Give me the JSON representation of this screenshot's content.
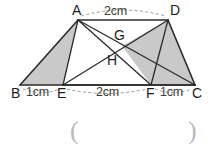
{
  "figure": {
    "type": "geometry-diagram",
    "canvas": {
      "width": 215,
      "height": 159
    },
    "colors": {
      "stroke": "#2b2b2b",
      "shade": "#c9c9c9",
      "shade_stroke": "#2b2b2b",
      "dash": "#8d8d8d",
      "text": "#262626",
      "paren": "#b9b9b9",
      "background": "#ffffff"
    },
    "vertices": [
      {
        "name": "A",
        "x": 78,
        "y": 20,
        "label": "A",
        "label_x": 72,
        "label_y": 3
      },
      {
        "name": "D",
        "x": 168,
        "y": 20,
        "label": "D",
        "label_x": 170,
        "label_y": 3
      },
      {
        "name": "B",
        "x": 20,
        "y": 85,
        "label": "B",
        "label_x": 11,
        "label_y": 86
      },
      {
        "name": "E",
        "x": 63,
        "y": 85,
        "label": "E",
        "label_x": 57,
        "label_y": 86
      },
      {
        "name": "F",
        "x": 151,
        "y": 85,
        "label": "F",
        "label_x": 146,
        "label_y": 86
      },
      {
        "name": "C",
        "x": 195,
        "y": 85,
        "label": "C",
        "label_x": 192,
        "label_y": 86
      },
      {
        "name": "G",
        "x": 122,
        "y": 46,
        "label": "G",
        "label_x": 114,
        "label_y": 28
      },
      {
        "name": "H",
        "x": 110,
        "y": 60,
        "label": "H",
        "label_x": 107,
        "label_y": 53
      }
    ],
    "segments": [
      {
        "name": "AD",
        "from": "A",
        "to": "D"
      },
      {
        "name": "BC",
        "from": "B",
        "to": "C"
      },
      {
        "name": "AB",
        "from": "A",
        "to": "B"
      },
      {
        "name": "DC",
        "from": "D",
        "to": "C"
      },
      {
        "name": "AE",
        "from": "A",
        "to": "E"
      },
      {
        "name": "AF",
        "from": "A",
        "to": "F"
      },
      {
        "name": "AC",
        "from": "A",
        "to": "C"
      },
      {
        "name": "ED",
        "from": "E",
        "to": "D"
      },
      {
        "name": "EC",
        "from": "E",
        "to": "C"
      },
      {
        "name": "FD",
        "from": "F",
        "to": "D"
      }
    ],
    "shaded_regions": [
      {
        "name": "triangle-ABE",
        "points": "A,B,E"
      },
      {
        "name": "quad-G-D-C-F",
        "points": "G,D,C,F"
      }
    ],
    "dimension_labels": [
      {
        "name": "dim-AD",
        "text": "2cm",
        "x": 104,
        "y": 5,
        "span_from": "A",
        "span_to": "D"
      },
      {
        "name": "dim-BE",
        "text": "1cm",
        "x": 26,
        "y": 86,
        "span_from": "B",
        "span_to": "E"
      },
      {
        "name": "dim-EF",
        "text": "2cm",
        "x": 96,
        "y": 86,
        "span_from": "E",
        "span_to": "F"
      },
      {
        "name": "dim-FC",
        "text": "1cm",
        "x": 160,
        "y": 86,
        "span_from": "F",
        "span_to": "C"
      }
    ],
    "answer_field": {
      "open_paren": "(",
      "close_paren": ")",
      "open_x": 70,
      "close_x": 188,
      "y": 118
    }
  }
}
